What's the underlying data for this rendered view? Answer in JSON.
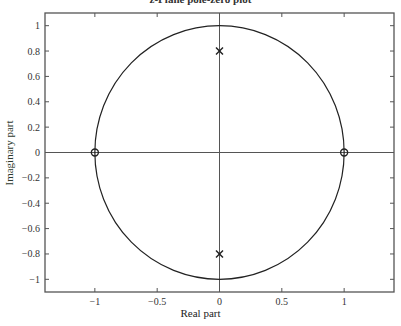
{
  "chart_data": {
    "type": "scatter",
    "title": "z-Plane pole-zero plot",
    "xlabel": "Real part",
    "ylabel": "Imaginary part",
    "xlim": [
      -1.4,
      1.4
    ],
    "ylim": [
      -1.1,
      1.1
    ],
    "grid": false,
    "xticks": [
      -1,
      -0.5,
      0,
      0.5,
      1
    ],
    "xtick_labels": [
      "−1",
      "−0.5",
      "0",
      "0.5",
      "1"
    ],
    "yticks": [
      1,
      0.8,
      0.6,
      0.4,
      0.2,
      0,
      -0.2,
      -0.4,
      -0.6,
      -0.8,
      -1
    ],
    "ytick_labels": [
      "1",
      "0.8",
      "0.6",
      "0.4",
      "0.2",
      "0",
      "−0.2",
      "−0.4",
      "−0.6",
      "−0.8",
      "−1"
    ],
    "unit_circle": {
      "center": [
        0,
        0
      ],
      "radius": 1
    },
    "series": [
      {
        "name": "zeros",
        "marker": "o",
        "points": [
          [
            -1,
            0
          ],
          [
            1,
            0
          ]
        ]
      },
      {
        "name": "poles",
        "marker": "x",
        "points": [
          [
            0,
            0.8
          ],
          [
            0,
            -0.8
          ]
        ]
      }
    ],
    "colors": {
      "axes": "#555555",
      "curve": "#222222",
      "ylabel": "#2e3a2e"
    }
  }
}
